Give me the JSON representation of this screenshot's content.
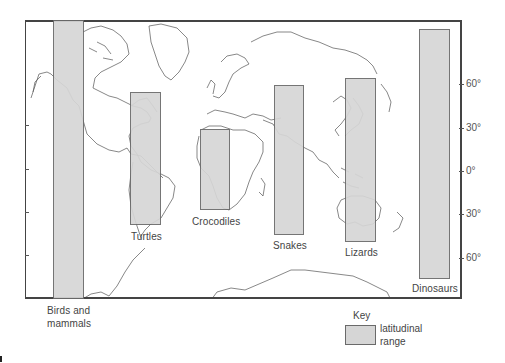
{
  "figure": {
    "axis": {
      "side": "right",
      "ticks": [
        {
          "label": "60°",
          "latitude": 60,
          "y": 84
        },
        {
          "label": "30°",
          "latitude": 30,
          "y": 128
        },
        {
          "label": "0°",
          "latitude": 0,
          "y": 171
        },
        {
          "label": "30°",
          "latitude": -30,
          "y": 214
        },
        {
          "label": "60°",
          "latitude": -60,
          "y": 258
        }
      ]
    },
    "groups": [
      {
        "name": "Birds and mammals",
        "label_line1": "Birds and",
        "label_line2": "mammals",
        "lat_north": 90,
        "lat_south": -90
      },
      {
        "name": "Turtles",
        "label": "Turtles",
        "lat_north": 55,
        "lat_south": -37
      },
      {
        "name": "Crocodiles",
        "label": "Crocodiles",
        "lat_north": 29,
        "lat_south": -27
      },
      {
        "name": "Snakes",
        "label": "Snakes",
        "lat_north": 60,
        "lat_south": -44
      },
      {
        "name": "Lizards",
        "label": "Lizards",
        "lat_north": 65,
        "lat_south": -49
      },
      {
        "name": "Dinosaurs",
        "label": "Dinosaurs",
        "lat_north": 85,
        "lat_south": -74
      }
    ],
    "key": {
      "title": "Key",
      "item_line1": "latitudinal",
      "item_line2": "range"
    },
    "colors": {
      "range_fill": "#d6d6d6",
      "range_border": "#6a6a6a",
      "frame": "#444444",
      "coastline": "#555555"
    }
  }
}
